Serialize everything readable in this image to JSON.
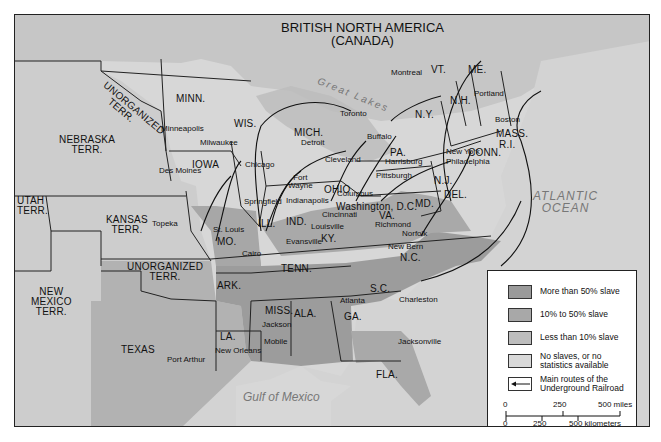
{
  "map": {
    "title": "BRITISH NORTH AMERICA",
    "subtitle": "(CANADA)",
    "water_labels": {
      "great_lakes": "Great Lakes",
      "atlantic_line1": "ATLANTIC",
      "atlantic_line2": "OCEAN",
      "gulf": "Gulf of Mexico"
    },
    "states": {
      "unorg_north_1": "UNORGANIZED",
      "unorg_north_2": "TERR.",
      "minn": "MINN.",
      "wis": "WIS.",
      "mich": "MICH.",
      "iowa": "IOWA",
      "nebraska_1": "NEBRASKA",
      "nebraska_2": "TERR.",
      "utah_1": "UTAH",
      "utah_2": "TERR.",
      "kansas_1": "KANSAS",
      "kansas_2": "TERR.",
      "unorg_south_1": "UNORGANIZED",
      "unorg_south_2": "TERR.",
      "newmexico_1": "NEW",
      "newmexico_2": "MEXICO",
      "newmexico_3": "TERR.",
      "texas": "TEXAS",
      "mo": "MO.",
      "ark": "ARK.",
      "la": "LA.",
      "ill": "ILL.",
      "ind": "IND.",
      "ohio": "OHIO",
      "ky": "KY.",
      "tenn": "TENN.",
      "miss": "MISS.",
      "ala": "ALA.",
      "ga": "GA.",
      "fla": "FLA.",
      "sc": "S.C.",
      "nc": "N.C.",
      "va": "VA.",
      "md": "MD.",
      "dc": "Washington, D.C.",
      "del": "DEL.",
      "nj": "N.J.",
      "pa": "PA.",
      "ny": "N.Y.",
      "vt": "VT.",
      "nh": "N.H.",
      "me": "ME.",
      "mass": "MASS.",
      "ri": "R.I.",
      "conn": "CONN."
    },
    "cities": {
      "minneapolis": "Minneapolis",
      "milwaukee": "Milwaukee",
      "chicago": "Chicago",
      "detroit": "Detroit",
      "toronto": "Toronto",
      "montreal": "Montreal",
      "buffalo": "Buffalo",
      "portland": "Portland",
      "boston": "Boston",
      "new_york": "New York",
      "philadelphia": "Philadelphia",
      "harrisburg": "Harrisburg",
      "pittsburgh": "Pittsburgh",
      "cleveland": "Cleveland",
      "fort_wayne_1": "Fort",
      "fort_wayne_2": "Wayne",
      "columbus": "Columbus",
      "indianapolis": "Indianapolis",
      "cincinnati": "Cincinnati",
      "springfield": "Springfield",
      "des_moines": "Des Moines",
      "topeka": "Topeka",
      "st_louis": "St. Louis",
      "louisville": "Louisville",
      "evansville": "Evansville",
      "cairo": "Cairo",
      "richmond": "Richmond",
      "norfolk": "Norfolk",
      "new_bern": "New Bern",
      "charleston": "Charleston",
      "atlanta": "Atlanta",
      "jackson": "Jackson",
      "mobile": "Mobile",
      "new_orleans": "New Orleans",
      "port_arthur": "Port Arthur",
      "jacksonville": "Jacksonville"
    }
  },
  "legend": {
    "items": [
      {
        "label": "More than 50% slave",
        "color": "#9a9a9a"
      },
      {
        "label": "10% to 50% slave",
        "color": "#a8a8a8"
      },
      {
        "label": "Less than 10% slave",
        "color": "#bdbdbd"
      },
      {
        "label_line1": "No slaves, or no",
        "label_line2": "statistics available",
        "color": "#d9d9d9"
      },
      {
        "label_line1": "Main routes of the",
        "label_line2": "Underground Railroad"
      }
    ],
    "scale": {
      "miles": [
        "0",
        "250",
        "500 miles"
      ],
      "km": [
        "0",
        "250",
        "500 kilometers"
      ]
    }
  },
  "colors": {
    "slave_high": "#9a9a9a",
    "slave_mid": "#a8a8a8",
    "slave_low": "#bdbdbd",
    "free": "#d9d9d9",
    "water": "#d0d0d0",
    "canada": "#c8c8c8",
    "border": "#222222"
  }
}
